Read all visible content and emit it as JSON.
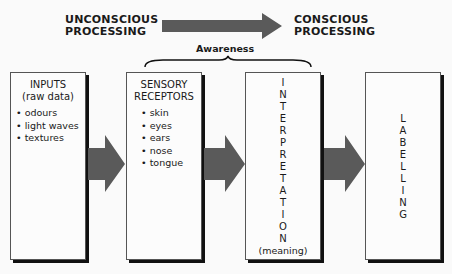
{
  "header": {
    "left_label_line1": "UNCONSCIOUS",
    "left_label_line2": "PROCESSING",
    "right_label_line1": "CONSCIOUS",
    "right_label_line2": "PROCESSING",
    "awareness_label": "Awareness"
  },
  "boxes": [
    {
      "title_line1": "INPUTS",
      "title_line2": "(raw data)",
      "items": [
        "odours",
        "light waves",
        "textures"
      ]
    },
    {
      "title_line1": "SENSORY",
      "title_line2": "RECEPTORS",
      "items": [
        "skin",
        "eyes",
        "ears",
        "nose",
        "tongue"
      ]
    },
    {
      "vertical_text": "INTERPRETATION",
      "subtitle": "(meaning)"
    },
    {
      "vertical_text": "LABELLING"
    }
  ],
  "colors": {
    "arrow": "#5a5a5a",
    "border": "#555555",
    "shadow": "#111111"
  }
}
